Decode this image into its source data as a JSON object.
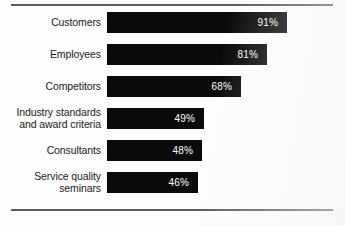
{
  "chart_data": {
    "type": "bar",
    "orientation": "horizontal",
    "title": "",
    "subtitle": "",
    "xlabel": "",
    "ylabel": "",
    "xlim": [
      0,
      100
    ],
    "grid": false,
    "legend": null,
    "value_suffix": "%",
    "categories": [
      "Customers",
      "Employees",
      "Competitors",
      "Industry standards\nand award criteria",
      "Consultants",
      "Service quality\nseminars"
    ],
    "values": [
      91,
      81,
      68,
      49,
      48,
      46
    ],
    "value_labels": [
      "91%",
      "81%",
      "68%",
      "49%",
      "48%",
      "46%"
    ],
    "colors": {
      "bar": "#0a0a0a",
      "value_text": "#ffffff",
      "category_text": "#1b1b1b",
      "background": "#fdfdfd",
      "rule": "#5c5c5c"
    }
  },
  "frame": {
    "top_rule": "",
    "bottom_rule": ""
  }
}
